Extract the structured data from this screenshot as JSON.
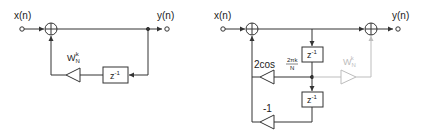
{
  "diagrams": [
    {
      "name": "first-order-goertzel-resonator",
      "input_label": "x(n)",
      "output_label": "y(n)",
      "delay_label": "z",
      "delay_exp": "-1",
      "gain_base": "W",
      "gain_sub": "N",
      "gain_sup": "-k"
    },
    {
      "name": "second-order-goertzel-resonator",
      "input_label": "x(n)",
      "output_label": "y(n)",
      "delay_label": "z",
      "delay_exp": "-1",
      "gain1_prefix": "2cos",
      "gain1_num": "2πk",
      "gain1_den": "N",
      "gain2": "-1",
      "gain3_base": "W",
      "gain3_sub": "N",
      "gain3_sup": "k"
    }
  ],
  "colors": {
    "line": "#333333",
    "feedforward": "#bdbdbd"
  }
}
